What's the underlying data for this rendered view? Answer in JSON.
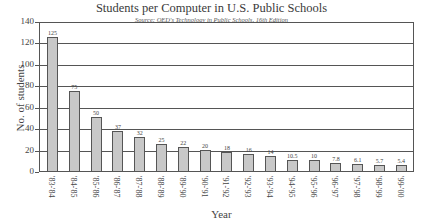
{
  "chart_data": {
    "type": "bar",
    "title": "Students per Computer in U.S. Public Schools",
    "subtitle": "Source: QED's Technology in Public Schools, 16th Edition",
    "xlabel": "Year",
    "ylabel": "No. of students",
    "ylim": [
      0,
      140
    ],
    "yticks": [
      0,
      20,
      40,
      60,
      80,
      100,
      120,
      140
    ],
    "grid": true,
    "categories": [
      "'83-'84",
      "'84-'85",
      "'85-'86",
      "'86-'87",
      "'87-'88",
      "'88-'89",
      "'89-'90",
      "'90-'91",
      "'91-'92",
      "'92-'93",
      "'93-'94",
      "'94-'95",
      "'95-'96",
      "'96-'97",
      "'97-'98",
      "'98-'99",
      "'99-'00"
    ],
    "values": [
      125,
      75,
      50,
      37,
      32,
      25,
      22,
      20,
      18,
      16,
      14,
      10.5,
      10,
      7.8,
      6.1,
      5.7,
      5.4
    ],
    "value_labels": [
      "125",
      "75",
      "50",
      "37",
      "32",
      "25",
      "22",
      "20",
      "18",
      "16",
      "14",
      "10.5",
      "10",
      "7.8",
      "6.1",
      "5.7",
      "5.4"
    ],
    "bar_color": "#c8c8c8",
    "edge_color": "#555555"
  }
}
